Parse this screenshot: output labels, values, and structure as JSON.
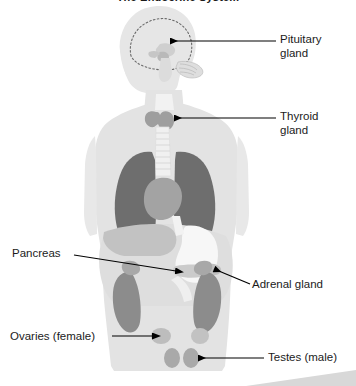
{
  "title": "The Endocrine System",
  "diagram": {
    "orientation": "head in left profile, torso frontal"
  },
  "labels": {
    "pituitary": "Pituitary\ngland",
    "thyroid": "Thyroid\ngland",
    "pancreas": "Pancreas",
    "adrenal": "Adrenal gland",
    "ovaries": "Ovaries (female)",
    "testes": "Testes (male)"
  },
  "colors": {
    "background": "#ffffff",
    "body_silhouette": "#e3e3e3",
    "body_outline": "#dadada",
    "head_fill": "#e8e8e8",
    "lung": "#6e6e6e",
    "liver": "#bdbdbd",
    "stomach": "#f4f4f4",
    "pancreas": "#cfcfcf",
    "kidney": "#8f8f8f",
    "adrenal": "#a8a8a8",
    "thyroid": "#9e9e9e",
    "pituitary": "#c9c9c9",
    "gonad": "#b0b0b0",
    "trachea": "#f0f0f0",
    "leader_line": "#000000",
    "text": "#1b1b1b",
    "corner_wedge": "#d6d6d6"
  },
  "leaders": [
    {
      "name": "pituitary",
      "from": [
        276,
        41
      ],
      "to": [
        168,
        41
      ],
      "arrow": "left"
    },
    {
      "name": "thyroid",
      "from": [
        276,
        118
      ],
      "to": [
        172,
        118
      ],
      "arrow": "left"
    },
    {
      "name": "pancreas",
      "from": [
        74,
        255
      ],
      "to": [
        178,
        272
      ],
      "arrow": "right"
    },
    {
      "name": "adrenal",
      "from": [
        250,
        284
      ],
      "to": [
        212,
        268
      ],
      "arrow": "left"
    },
    {
      "name": "ovaries",
      "from": [
        112,
        336
      ],
      "to": [
        155,
        336
      ],
      "arrow": "right"
    },
    {
      "name": "testes",
      "from": [
        264,
        358
      ],
      "to": [
        196,
        358
      ],
      "arrow": "left"
    }
  ]
}
